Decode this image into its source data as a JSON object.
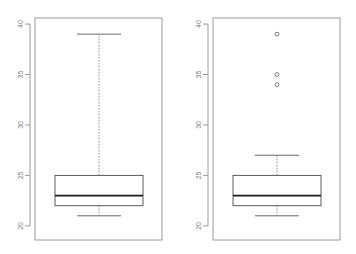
{
  "figure": {
    "background": "#ffffff",
    "panel_count": 2,
    "width": 356,
    "height": 254
  },
  "style": {
    "frame_color": "#9a9a9a",
    "axis_color": "#9a9a9a",
    "tick_label_color": "#808080",
    "box_border_color": "#5a5a5a",
    "median_color": "#1a1a1a",
    "whisker_color": "#8a8a8a",
    "cap_color": "#6a6a6a",
    "outlier_color": "#7a7a7a",
    "tick_label_rotation": -90
  },
  "chart_data": [
    {
      "type": "box",
      "name": "left-boxplot",
      "title": "",
      "xlabel": "",
      "ylabel": "",
      "ylim": [
        18.6,
        40.6
      ],
      "grid": false,
      "legend": null,
      "y_ticks": [
        20,
        25,
        30,
        35,
        40
      ],
      "y_tick_labels": [
        "20",
        "25",
        "30",
        "35",
        "40"
      ],
      "boxes": [
        {
          "label": "",
          "lower_whisker": 21.0,
          "q1": 22.0,
          "median": 23.0,
          "q3": 25.0,
          "upper_whisker": 39.0,
          "outliers": []
        }
      ]
    },
    {
      "type": "box",
      "name": "right-boxplot",
      "title": "",
      "xlabel": "",
      "ylabel": "",
      "ylim": [
        18.6,
        40.6
      ],
      "grid": false,
      "legend": null,
      "y_ticks": [
        20,
        25,
        30,
        35,
        40
      ],
      "y_tick_labels": [
        "20",
        "25",
        "30",
        "35",
        "40"
      ],
      "boxes": [
        {
          "label": "",
          "lower_whisker": 21.0,
          "q1": 22.0,
          "median": 23.0,
          "q3": 25.0,
          "upper_whisker": 27.0,
          "outliers": [
            39.0,
            35.0,
            34.0
          ]
        }
      ]
    }
  ]
}
